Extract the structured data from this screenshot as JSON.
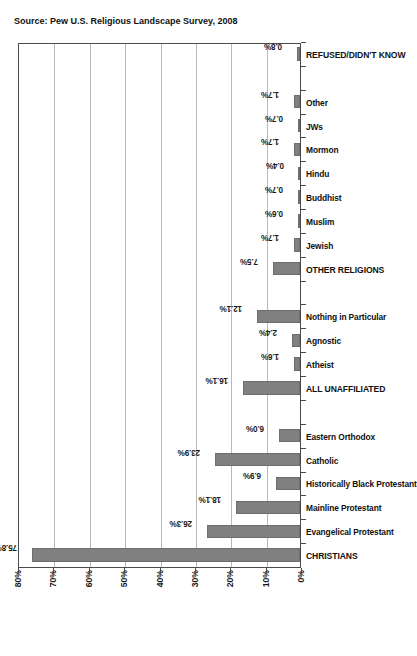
{
  "chart_data": {
    "type": "bar",
    "title": "",
    "subtitle": "",
    "xlabel": "",
    "ylabel": "",
    "ylim": [
      0,
      80
    ],
    "grid": true,
    "legend": false,
    "orientation": "vertical-rotated-90ccw",
    "bar_color": "#808080",
    "axis_tick_labels": [
      "0%",
      "10%",
      "20%",
      "30%",
      "40%",
      "50%",
      "60%",
      "70%",
      "80%"
    ],
    "axis_tick_values": [
      0,
      10,
      20,
      30,
      40,
      50,
      60,
      70,
      80
    ],
    "categories": [
      "CHRISTIANS",
      "Evangelical Protestant",
      "Mainline Protestant",
      "Historically Black Protestant",
      "Catholic",
      "Eastern Orthodox",
      "",
      "ALL UNAFFILIATED",
      "Atheist",
      "Agnostic",
      "Nothing in Particular",
      "",
      "OTHER RELIGIONS",
      "Jewish",
      "Muslim",
      "Buddhist",
      "Hindu",
      "Mormon",
      "JWs",
      "Other",
      "",
      "REFUSED/DIDN'T KNOW"
    ],
    "values": [
      75.8,
      26.3,
      18.1,
      6.9,
      23.9,
      6.0,
      null,
      16.1,
      1.6,
      2.4,
      12.1,
      null,
      7.5,
      1.7,
      0.6,
      0.7,
      0.4,
      1.7,
      0.7,
      1.7,
      null,
      0.8
    ],
    "data_labels": [
      "75.8%",
      "26.3%",
      "18.1%",
      "6.9%",
      "23.9%",
      "6.0%",
      "",
      "16.1%",
      "1.6%",
      "2.4%",
      "12.1%",
      "",
      "7.5%",
      "1.7%",
      "0.6%",
      "0.7%",
      "0.4%",
      "1.7%",
      "0.7%",
      "1.7%",
      "",
      "0.8%"
    ],
    "groups": [
      {
        "name": "CHRISTIANS",
        "members": [
          "Evangelical Protestant",
          "Mainline Protestant",
          "Historically Black Protestant",
          "Catholic",
          "Eastern Orthodox"
        ]
      },
      {
        "name": "ALL UNAFFILIATED",
        "members": [
          "Atheist",
          "Agnostic",
          "Nothing in Particular"
        ]
      },
      {
        "name": "OTHER RELIGIONS",
        "members": [
          "Jewish",
          "Muslim",
          "Buddhist",
          "Hindu",
          "Mormon",
          "JWs",
          "Other"
        ]
      },
      {
        "name": "REFUSED/DIDN'T KNOW",
        "members": []
      }
    ],
    "annotations": {
      "source": "Source: Pew U.S. Religious Landscape Survey, 2008"
    }
  },
  "figure": {
    "source_note": "Source: Pew U.S. Religious Landscape Survey, 2008"
  }
}
